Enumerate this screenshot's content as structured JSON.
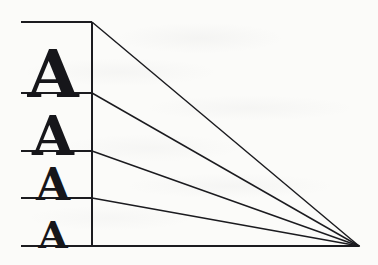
{
  "figure": {
    "background_color": "#fbfbf9",
    "ink_color": "#1b1b1f",
    "canvas": {
      "width": 378,
      "height": 265
    }
  },
  "geometry": {
    "left_margin_x": 21,
    "vertical_divider_x": 92,
    "vanishing_point": {
      "x": 359,
      "y": 246
    },
    "baseline_y_values": [
      22,
      93,
      151,
      198,
      246
    ],
    "rule_stroke_width": 2.1,
    "ray_stroke_width": 1.45,
    "divider_stroke_width": 2.0
  },
  "rules": [
    {
      "name": "rule-top",
      "y": 22,
      "x_start": 21,
      "x_end": 92
    },
    {
      "name": "rule-second",
      "y": 93,
      "x_start": 21,
      "x_end": 92
    },
    {
      "name": "rule-third",
      "y": 151,
      "x_start": 21,
      "x_end": 92
    },
    {
      "name": "rule-fourth",
      "y": 198,
      "x_start": 21,
      "x_end": 92
    },
    {
      "name": "rule-bottom",
      "y": 246,
      "x_start": 21,
      "x_end": 359
    }
  ],
  "rays": [
    {
      "name": "ray-1",
      "from_x": 92,
      "from_y": 22,
      "to_x": 359,
      "to_y": 246
    },
    {
      "name": "ray-2",
      "from_x": 92,
      "from_y": 93,
      "to_x": 359,
      "to_y": 246
    },
    {
      "name": "ray-3",
      "from_x": 92,
      "from_y": 151,
      "to_x": 359,
      "to_y": 246
    },
    {
      "name": "ray-4",
      "from_x": 92,
      "from_y": 198,
      "to_x": 359,
      "to_y": 246
    }
  ],
  "letters": [
    {
      "name": "letter-a-1",
      "char": "A",
      "font_size": 66,
      "center_x": 53,
      "baseline_y": 90,
      "band": 1
    },
    {
      "name": "letter-a-2",
      "char": "A",
      "font_size": 54,
      "center_x": 53,
      "baseline_y": 149,
      "band": 2
    },
    {
      "name": "letter-a-3",
      "char": "A",
      "font_size": 44,
      "center_x": 53,
      "baseline_y": 196,
      "band": 3
    },
    {
      "name": "letter-a-4",
      "char": "A",
      "font_size": 38,
      "center_x": 53,
      "baseline_y": 244,
      "band": 4
    }
  ],
  "chart_data": {
    "type": "line",
    "subtitle": "Four capital A glyphs of decreasing size with convergence rays",
    "xlabel": "",
    "ylabel": "",
    "xlim": [
      0,
      378
    ],
    "ylim": [
      265,
      0
    ],
    "grid": false,
    "legend": null,
    "annotations": [],
    "series": [
      {
        "name": "rule-top",
        "x": [
          21,
          92
        ],
        "y": [
          22,
          22
        ]
      },
      {
        "name": "rule-second",
        "x": [
          21,
          92
        ],
        "y": [
          93,
          93
        ]
      },
      {
        "name": "rule-third",
        "x": [
          21,
          92
        ],
        "y": [
          151,
          151
        ]
      },
      {
        "name": "rule-fourth",
        "x": [
          21,
          92
        ],
        "y": [
          198,
          198
        ]
      },
      {
        "name": "rule-bottom",
        "x": [
          21,
          359
        ],
        "y": [
          246,
          246
        ]
      },
      {
        "name": "divider",
        "x": [
          92,
          92
        ],
        "y": [
          22,
          246
        ]
      },
      {
        "name": "ray-1",
        "x": [
          92,
          359
        ],
        "y": [
          22,
          246
        ]
      },
      {
        "name": "ray-2",
        "x": [
          92,
          359
        ],
        "y": [
          93,
          246
        ]
      },
      {
        "name": "ray-3",
        "x": [
          92,
          359
        ],
        "y": [
          151,
          246
        ]
      },
      {
        "name": "ray-4",
        "x": [
          92,
          359
        ],
        "y": [
          198,
          246
        ]
      }
    ],
    "point_labels": [
      {
        "label": "A",
        "x": 53,
        "y": 90,
        "size": 66
      },
      {
        "label": "A",
        "x": 53,
        "y": 149,
        "size": 54
      },
      {
        "label": "A",
        "x": 53,
        "y": 196,
        "size": 44
      },
      {
        "label": "A",
        "x": 53,
        "y": 244,
        "size": 38
      }
    ]
  }
}
